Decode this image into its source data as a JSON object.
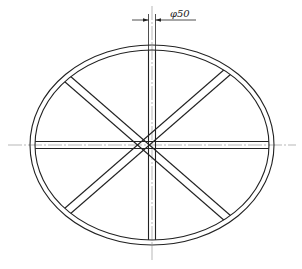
{
  "drawing": {
    "type": "technical-drawing",
    "subject": "elliptical ring frame with radial spokes",
    "dimension": {
      "label": "φ50",
      "symbol": "φ",
      "value": "50"
    },
    "ring": {
      "outer": {
        "cx": 152,
        "cy": 145,
        "rx": 122,
        "ry": 100
      },
      "inner": {
        "cx": 152,
        "cy": 145,
        "rx": 117,
        "ry": 95
      }
    },
    "spokes": {
      "count": 4,
      "orientations": [
        "vertical",
        "horizontal",
        "diagonal-up",
        "diagonal-down"
      ],
      "width_px": 7
    },
    "colors": {
      "line": "#222222",
      "centerline": "#9a9a9a",
      "background": "#ffffff"
    }
  }
}
